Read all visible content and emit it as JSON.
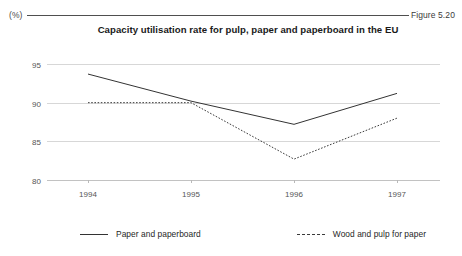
{
  "header": {
    "unit_label": "(%)",
    "figure_number": "Figure 5.20"
  },
  "chart_data": {
    "type": "line",
    "title": "Capacity utilisation rate for pulp, paper and paperboard in the EU",
    "xlabel": "",
    "ylabel": "(%)",
    "categories": [
      "1994",
      "1995",
      "1996",
      "1997"
    ],
    "x": [
      1994,
      1995,
      1996,
      1997
    ],
    "ylim": [
      80,
      95
    ],
    "yticks": [
      80,
      85,
      90,
      95
    ],
    "ytick_labels": [
      "80",
      "85",
      "90",
      "95"
    ],
    "grid": "horizontal",
    "legend_position": "bottom",
    "series": [
      {
        "name": "Paper and paperboard",
        "style": "solid",
        "color": "#333333",
        "values": [
          93.7,
          90.2,
          87.2,
          91.2
        ]
      },
      {
        "name": "Wood and pulp for paper",
        "style": "dotted",
        "color": "#3a3a3a",
        "values": [
          90.0,
          90.0,
          82.7,
          88.0
        ]
      }
    ]
  },
  "legend": {
    "items": [
      {
        "label": "Paper and paperboard",
        "style": "solid"
      },
      {
        "label": "Wood and pulp for paper",
        "style": "dashed"
      }
    ]
  }
}
